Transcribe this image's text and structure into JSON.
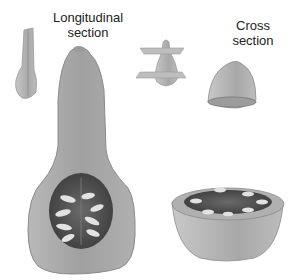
{
  "figure": {
    "labels": {
      "longitudinal_line1": "Longitudinal",
      "longitudinal_line2": "section",
      "cross_line1": "Cross",
      "cross_line2": "section"
    },
    "parts": [
      {
        "name": "whole-fruit-small",
        "description": "small whole fruit with longitudinal cut"
      },
      {
        "name": "longitudinal-half",
        "description": "large longitudinal half showing seed cavity"
      },
      {
        "name": "cutting-planes",
        "description": "fruit with two horizontal cutting planes"
      },
      {
        "name": "cross-section-cap",
        "description": "top cap after cross cut"
      },
      {
        "name": "cross-section-bowl",
        "description": "bottom bowl showing seed cavity in cross section"
      }
    ],
    "colors": {
      "flesh": "#a8a8a8",
      "flesh_light": "#c4c4c4",
      "cavity": "#555555",
      "seed": "#e2e2e2",
      "outline": "#8a8a8a"
    }
  }
}
